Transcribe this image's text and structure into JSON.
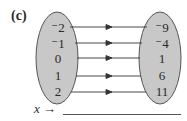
{
  "label": "(c)",
  "domain_values": [
    "⁻2",
    "⁻1",
    "0",
    "1",
    "2"
  ],
  "range_values": [
    "⁻9",
    "⁻4",
    "1",
    "6",
    "11"
  ],
  "rule_prefix": "x →",
  "rule_blank": "",
  "colors": {
    "oval_fill": "#c8c8c8",
    "oval_stroke": "#555555",
    "arrow": "#333333"
  }
}
